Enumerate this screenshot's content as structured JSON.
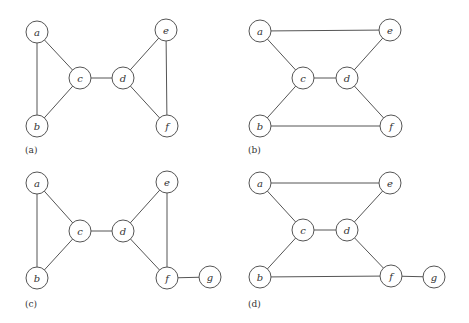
{
  "figure": {
    "node_radius": 11,
    "panels": [
      {
        "id": "a",
        "label": "(a)",
        "label_pos": [
          25,
          153
        ],
        "nodes": [
          {
            "id": "a",
            "label": "a",
            "x": 37,
            "y": 32
          },
          {
            "id": "b",
            "label": "b",
            "x": 37,
            "y": 126
          },
          {
            "id": "c",
            "label": "c",
            "x": 80,
            "y": 78
          },
          {
            "id": "d",
            "label": "d",
            "x": 123,
            "y": 78
          },
          {
            "id": "e",
            "label": "e",
            "x": 166,
            "y": 30
          },
          {
            "id": "f",
            "label": "f",
            "x": 167,
            "y": 126
          }
        ],
        "edges": [
          [
            "a",
            "b"
          ],
          [
            "a",
            "c"
          ],
          [
            "b",
            "c"
          ],
          [
            "c",
            "d"
          ],
          [
            "d",
            "e"
          ],
          [
            "d",
            "f"
          ],
          [
            "e",
            "f"
          ]
        ]
      },
      {
        "id": "b",
        "label": "(b)",
        "label_pos": [
          248,
          153
        ],
        "nodes": [
          {
            "id": "a",
            "label": "a",
            "x": 260,
            "y": 31
          },
          {
            "id": "b",
            "label": "b",
            "x": 260,
            "y": 126
          },
          {
            "id": "c",
            "label": "c",
            "x": 303,
            "y": 78
          },
          {
            "id": "d",
            "label": "d",
            "x": 347,
            "y": 78
          },
          {
            "id": "e",
            "label": "e",
            "x": 390,
            "y": 30
          },
          {
            "id": "f",
            "label": "f",
            "x": 391,
            "y": 126
          }
        ],
        "edges": [
          [
            "a",
            "e"
          ],
          [
            "a",
            "c"
          ],
          [
            "b",
            "c"
          ],
          [
            "c",
            "d"
          ],
          [
            "d",
            "e"
          ],
          [
            "d",
            "f"
          ],
          [
            "b",
            "f"
          ]
        ]
      },
      {
        "id": "c",
        "label": "(c)",
        "label_pos": [
          25,
          307
        ],
        "nodes": [
          {
            "id": "a",
            "label": "a",
            "x": 37,
            "y": 183
          },
          {
            "id": "b",
            "label": "b",
            "x": 37,
            "y": 278
          },
          {
            "id": "c",
            "label": "c",
            "x": 80,
            "y": 231
          },
          {
            "id": "d",
            "label": "d",
            "x": 123,
            "y": 231
          },
          {
            "id": "e",
            "label": "e",
            "x": 167,
            "y": 182
          },
          {
            "id": "f",
            "label": "f",
            "x": 167,
            "y": 278
          },
          {
            "id": "g",
            "label": "g",
            "x": 210,
            "y": 277
          }
        ],
        "edges": [
          [
            "a",
            "b"
          ],
          [
            "a",
            "c"
          ],
          [
            "b",
            "c"
          ],
          [
            "c",
            "d"
          ],
          [
            "d",
            "e"
          ],
          [
            "d",
            "f"
          ],
          [
            "e",
            "f"
          ],
          [
            "f",
            "g"
          ]
        ]
      },
      {
        "id": "d",
        "label": "(d)",
        "label_pos": [
          248,
          307
        ],
        "nodes": [
          {
            "id": "a",
            "label": "a",
            "x": 260,
            "y": 183
          },
          {
            "id": "b",
            "label": "b",
            "x": 260,
            "y": 277
          },
          {
            "id": "c",
            "label": "c",
            "x": 303,
            "y": 230
          },
          {
            "id": "d",
            "label": "d",
            "x": 347,
            "y": 230
          },
          {
            "id": "e",
            "label": "e",
            "x": 390,
            "y": 183
          },
          {
            "id": "f",
            "label": "f",
            "x": 391,
            "y": 276
          },
          {
            "id": "g",
            "label": "g",
            "x": 434,
            "y": 277
          }
        ],
        "edges": [
          [
            "a",
            "e"
          ],
          [
            "a",
            "c"
          ],
          [
            "b",
            "c"
          ],
          [
            "c",
            "d"
          ],
          [
            "d",
            "e"
          ],
          [
            "d",
            "f"
          ],
          [
            "b",
            "f"
          ],
          [
            "f",
            "g"
          ]
        ]
      }
    ]
  }
}
